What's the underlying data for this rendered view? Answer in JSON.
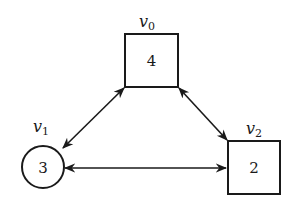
{
  "diagram": {
    "type": "graph",
    "nodes": [
      {
        "id": "v0",
        "label_main": "v",
        "label_sub": "0",
        "value": "4",
        "shape": "square"
      },
      {
        "id": "v1",
        "label_main": "v",
        "label_sub": "1",
        "value": "3",
        "shape": "circle"
      },
      {
        "id": "v2",
        "label_main": "v",
        "label_sub": "2",
        "value": "2",
        "shape": "square"
      }
    ],
    "edges": [
      {
        "from": "v0",
        "to": "v1",
        "direction": "bidirectional"
      },
      {
        "from": "v0",
        "to": "v2",
        "direction": "bidirectional"
      },
      {
        "from": "v1",
        "to": "v2",
        "direction": "bidirectional"
      }
    ]
  },
  "colors": {
    "stroke": "#1a1a1a",
    "background": "#ffffff"
  }
}
